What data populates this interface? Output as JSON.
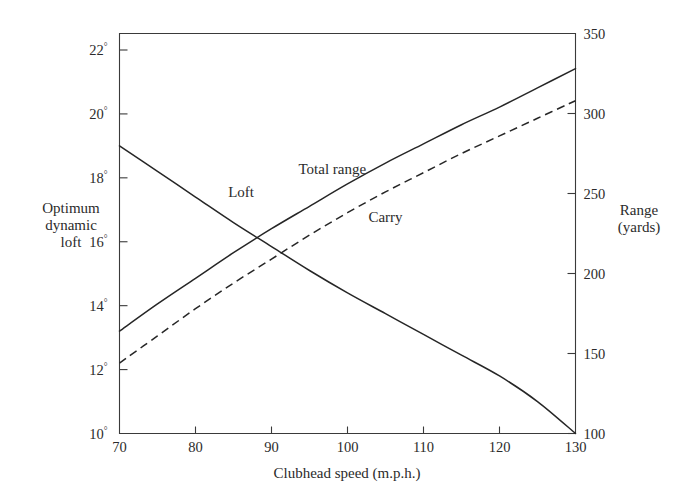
{
  "figure": {
    "background": "#ffffff",
    "ink_color": "#2b2b2b",
    "curve_color": "#262626"
  },
  "chart_data": {
    "type": "line",
    "title": "",
    "xlabel": "Clubhead speed (m.p.h.)",
    "ylabel_left": "Optimum dynamic loft",
    "ylabel_left_lines": [
      "Optimum",
      "dynamic",
      "loft"
    ],
    "ylabel_right": "Range (yards)",
    "ylabel_right_lines": [
      "Range",
      "(yards)"
    ],
    "grid": false,
    "legend_position": "inline-labels",
    "xlim": [
      70,
      130
    ],
    "xticks": [
      70,
      80,
      90,
      100,
      110,
      120,
      130
    ],
    "xticklabels": [
      "70",
      "80",
      "90",
      "100",
      "110",
      "120",
      "130"
    ],
    "ylim_left": [
      10,
      22
    ],
    "yticks_left": [
      10,
      12,
      14,
      16,
      18,
      20,
      22
    ],
    "yticklabels_left": [
      "10°",
      "12°",
      "14°",
      "16°",
      "18°",
      "20°",
      "22°"
    ],
    "ytick_left_numbers": [
      "10",
      "12",
      "14",
      "16",
      "18",
      "20",
      "22"
    ],
    "ytick_left_degree": "°",
    "ylim_right": [
      100,
      350
    ],
    "yticks_right": [
      100,
      150,
      200,
      250,
      300,
      350
    ],
    "yticklabels_right": [
      "100",
      "150",
      "200",
      "250",
      "300",
      "350"
    ],
    "x": [
      70,
      75,
      80,
      85,
      90,
      95,
      100,
      105,
      110,
      115,
      120,
      125,
      130
    ],
    "series": [
      {
        "name": "Loft",
        "axis": "left",
        "units": "degrees",
        "style": "solid",
        "label_x": 86,
        "label_y_deg": 17.4,
        "values": [
          19.0,
          18.2,
          17.4,
          16.6,
          15.85,
          15.1,
          14.4,
          13.75,
          13.1,
          12.45,
          11.8,
          11.0,
          10.0
        ]
      },
      {
        "name": "Total range",
        "axis": "right",
        "units": "yards",
        "style": "solid",
        "label_x": 98,
        "label_y_yards": 262,
        "values": [
          164,
          181,
          197,
          213,
          228,
          242,
          256,
          269,
          281,
          293,
          304,
          316,
          328
        ]
      },
      {
        "name": "Carry",
        "axis": "right",
        "units": "yards",
        "style": "dashed",
        "label_x": 105,
        "label_y_yards": 232,
        "values": [
          144,
          161,
          178,
          194,
          209,
          224,
          238,
          251,
          263,
          275,
          286,
          297,
          308
        ]
      }
    ]
  }
}
